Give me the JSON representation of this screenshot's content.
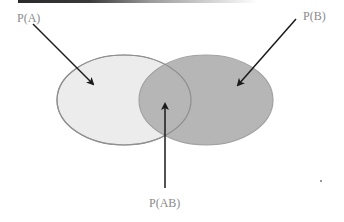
{
  "diagram": {
    "type": "venn",
    "sets": [
      {
        "id": "A",
        "label": "P(A)",
        "fill": "#ececec",
        "stroke": "#9c9c9c"
      },
      {
        "id": "B",
        "label": "P(B)",
        "fill": "#b6b6b6",
        "stroke": "#a2a2a2"
      }
    ],
    "intersection": {
      "id": "AB",
      "label": "P(AB)"
    },
    "colors": {
      "arrow": "#1a1a1a",
      "label_text": "#8a8a8a",
      "background": "#ffffff"
    }
  }
}
